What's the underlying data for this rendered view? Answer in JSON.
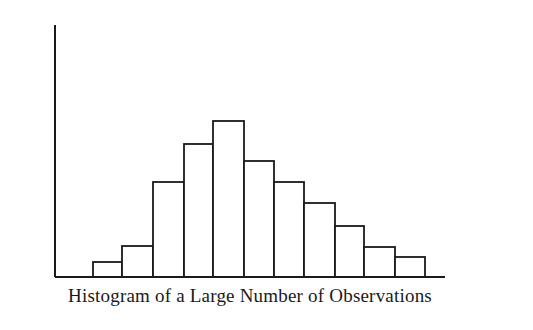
{
  "chart_data": {
    "type": "bar",
    "title": "Histogram of a Large Number of Observations",
    "xlabel": "",
    "ylabel": "",
    "categories": [
      "1",
      "2",
      "3",
      "4",
      "5",
      "6",
      "7",
      "8",
      "9",
      "10",
      "11"
    ],
    "values": [
      15,
      31,
      95,
      133,
      156,
      116,
      95,
      74,
      51,
      30,
      20
    ],
    "value_units": "relative height (px above baseline, no axis scale shown)",
    "ylim": [
      0,
      252
    ],
    "grid": false,
    "legend": null,
    "axis_ticks": "none",
    "bar_fill": "#ffffff",
    "bar_stroke": "#1a1a1a"
  },
  "layout": {
    "axis_left_x": 55,
    "baseline_y": 277,
    "axis_top_y": 25,
    "axis_right_x": 445,
    "bar_edges_x": [
      93,
      122,
      153,
      184,
      213,
      244,
      274,
      304,
      335,
      364,
      395,
      425
    ]
  }
}
